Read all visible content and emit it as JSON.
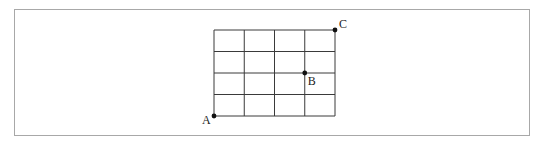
{
  "diagram": {
    "type": "grid-path",
    "grid": {
      "columns": 4,
      "rows": 4,
      "origin_px": [
        214,
        30
      ],
      "cell_width_px": 30.25,
      "cell_height_px": 21.5,
      "line_color": "#3a3a3a"
    },
    "points": [
      {
        "label": "A",
        "grid_col": 0,
        "grid_row": 4,
        "label_dx": -12,
        "label_dy": 8
      },
      {
        "label": "B",
        "grid_col": 3,
        "grid_row": 2,
        "label_dx": 3,
        "label_dy": 12
      },
      {
        "label": "C",
        "grid_col": 4,
        "grid_row": 0,
        "label_dx": 4,
        "label_dy": -2
      }
    ],
    "frame_color": "#a8a8a8",
    "point_color": "#111111"
  }
}
